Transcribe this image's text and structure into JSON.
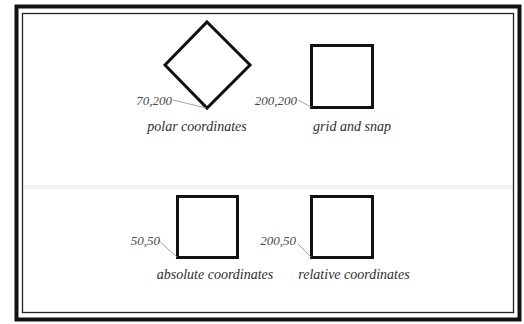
{
  "diagram": {
    "colors": {
      "background": "#ffffff",
      "frame": "#111111",
      "shape_stroke": "#111111",
      "leader_line": "#9a9a9a",
      "text": "#333333",
      "faint_band": "#f1f1f1"
    },
    "panels": [
      {
        "id": "polar",
        "shape": "diamond",
        "coordinate_label": "70,200",
        "caption": "polar coordinates"
      },
      {
        "id": "grid",
        "shape": "square",
        "coordinate_label": "200,200",
        "caption": "grid and snap"
      },
      {
        "id": "absolute",
        "shape": "square",
        "coordinate_label": "50,50",
        "caption": "absolute coordinates"
      },
      {
        "id": "relative",
        "shape": "square",
        "coordinate_label": "200,50",
        "caption": "relative coordinates"
      }
    ]
  }
}
